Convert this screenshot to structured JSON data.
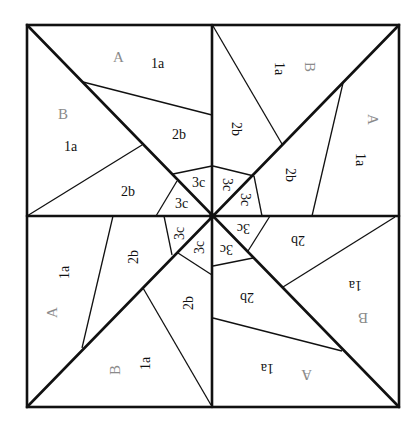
{
  "diagram": {
    "type": "quilt-block-pattern",
    "colors": {
      "line": "#111111",
      "section_letter": "#8a8a8a",
      "piece_label": "#111111",
      "background": "#ffffff"
    },
    "quadrants": [
      {
        "position": "top-left",
        "sections": [
          {
            "letter": "A",
            "pieces": [
              "1a",
              "2b",
              "3c"
            ]
          },
          {
            "letter": "B",
            "pieces": [
              "1a",
              "2b",
              "3c"
            ]
          }
        ]
      },
      {
        "position": "top-right",
        "sections": [
          {
            "letter": "B",
            "pieces": [
              "1a",
              "2b",
              "3c"
            ]
          },
          {
            "letter": "A",
            "pieces": [
              "1a",
              "2b",
              "3c"
            ]
          }
        ]
      },
      {
        "position": "bottom-right",
        "sections": [
          {
            "letter": "B",
            "pieces": [
              "1a",
              "2b",
              "3c"
            ]
          },
          {
            "letter": "A",
            "pieces": [
              "1a",
              "2b",
              "3c"
            ]
          }
        ]
      },
      {
        "position": "bottom-left",
        "sections": [
          {
            "letter": "A",
            "pieces": [
              "1a",
              "2b",
              "3c"
            ]
          },
          {
            "letter": "B",
            "pieces": [
              "1a",
              "2b",
              "3c"
            ]
          }
        ]
      }
    ],
    "labels": {
      "tl": {
        "A": "A",
        "A1": "1a",
        "A2": "2b",
        "A3": "3c",
        "B": "B",
        "B1": "1a",
        "B2": "2b",
        "B3": "3c"
      },
      "tr": {
        "A": "A",
        "A1": "1a",
        "A2": "2b",
        "A3": "3c",
        "B": "B",
        "B1": "1a",
        "B2": "2b",
        "B3": "3c"
      },
      "br": {
        "A": "A",
        "A1": "1a",
        "A2": "2b",
        "A3": "3c",
        "B": "B",
        "B1": "1a",
        "B2": "2b",
        "B3": "3c"
      },
      "bl": {
        "A": "A",
        "A1": "1a",
        "A2": "2b",
        "A3": "3c",
        "B": "B",
        "B1": "1a",
        "B2": "2b",
        "B3": "3c"
      }
    }
  }
}
